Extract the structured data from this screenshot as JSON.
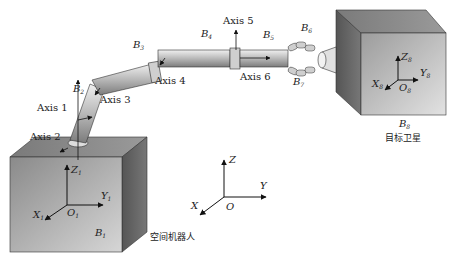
{
  "diagram": {
    "bodies": {
      "b1": {
        "label": "B",
        "sub": "1"
      },
      "b2": {
        "label": "B",
        "sub": "2"
      },
      "b3": {
        "label": "B",
        "sub": "3"
      },
      "b4": {
        "label": "B",
        "sub": "4"
      },
      "b5": {
        "label": "B",
        "sub": "5"
      },
      "b6": {
        "label": "B",
        "sub": "6"
      },
      "b7": {
        "label": "B",
        "sub": "7"
      },
      "b8": {
        "label": "B",
        "sub": "8"
      }
    },
    "axes": {
      "axis1": "Axis 1",
      "axis2": "Axis 2",
      "axis3": "Axis 3",
      "axis4": "Axis 4",
      "axis5": "Axis 5",
      "axis6": "Axis 6"
    },
    "frames": {
      "base": {
        "x": "X",
        "y": "Y",
        "z": "Z",
        "o": "O",
        "sub": "1"
      },
      "target": {
        "x": "X",
        "y": "Y",
        "z": "Z",
        "o": "O",
        "sub": "8"
      },
      "inertial": {
        "x": "X",
        "y": "Y",
        "z": "Z",
        "o": "O"
      }
    },
    "captions": {
      "space_robot": "空间机器人",
      "target_satellite": "目标卫星"
    }
  }
}
